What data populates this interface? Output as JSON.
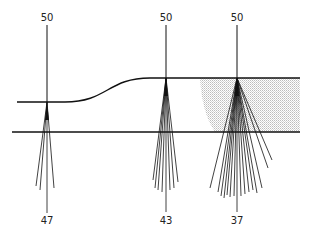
{
  "diagram": {
    "colors": {
      "line": "#111111",
      "shade": "#c8c8c8",
      "background": "#ffffff"
    },
    "stations": [
      {
        "x": 47,
        "top_label": "50",
        "bottom_label": "47",
        "surface_y": 102,
        "rays_end": [
          [
            36,
            186
          ],
          [
            40,
            190
          ],
          [
            47,
            213
          ],
          [
            54,
            188
          ]
        ]
      },
      {
        "x": 166,
        "top_label": "50",
        "bottom_label": "43",
        "surface_y": 78,
        "rays_end": [
          [
            153,
            180
          ],
          [
            155,
            188
          ],
          [
            158,
            190
          ],
          [
            162,
            192
          ],
          [
            166,
            212
          ],
          [
            170,
            190
          ],
          [
            174,
            188
          ],
          [
            178,
            182
          ]
        ]
      },
      {
        "x": 237,
        "top_label": "50",
        "bottom_label": "37",
        "surface_y": 78,
        "rays_end": [
          [
            210,
            188
          ],
          [
            218,
            192
          ],
          [
            221,
            196
          ],
          [
            224,
            198
          ],
          [
            227,
            195
          ],
          [
            230,
            197
          ],
          [
            234,
            196
          ],
          [
            237,
            212
          ],
          [
            241,
            196
          ],
          [
            245,
            194
          ],
          [
            249,
            192
          ],
          [
            253,
            190
          ],
          [
            257,
            193
          ],
          [
            262,
            188
          ],
          [
            268,
            168
          ],
          [
            272,
            160
          ]
        ]
      }
    ],
    "upper_surface": {
      "left_y": 102,
      "right_y": 78,
      "x_start": 17,
      "curve_start_x": 65,
      "curve_end_x": 150,
      "x_end": 300
    },
    "lower_line": {
      "y": 132,
      "x_start": 12,
      "x_end": 300
    },
    "shaded_region": {
      "top_left_x": 200,
      "bottom_left_x": 215,
      "right_x": 300,
      "top_y": 78,
      "bottom_y": 132
    }
  }
}
